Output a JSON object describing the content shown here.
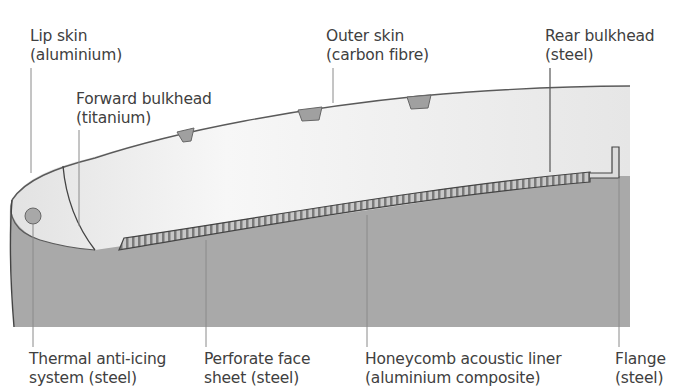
{
  "diagram": {
    "colors": {
      "body_gray": "#a9a9a9",
      "skin_light": "#ececec",
      "outline": "#555555",
      "leader_line": "#8a8a8a",
      "stiffener": "#a0a0a0",
      "text": "#404040"
    },
    "labels_top": [
      {
        "id": "lip-skin",
        "line1": "Lip skin",
        "line2": "(aluminium)"
      },
      {
        "id": "forward-bulkhead",
        "line1": "Forward bulkhead",
        "line2": "(titanium)"
      },
      {
        "id": "outer-skin",
        "line1": "Outer skin",
        "line2": "(carbon fibre)"
      },
      {
        "id": "rear-bulkhead",
        "line1": "Rear bulkhead",
        "line2": "(steel)"
      }
    ],
    "labels_bottom": [
      {
        "id": "thermal-anti-icing",
        "line1": "Thermal anti-icing",
        "line2": "system (steel)"
      },
      {
        "id": "perforate-face-sheet",
        "line1": "Perforate face",
        "line2": "sheet (steel)"
      },
      {
        "id": "honeycomb-liner",
        "line1": "Honeycomb acoustic liner",
        "line2": "(aluminium composite)"
      },
      {
        "id": "flange",
        "line1": "Flange",
        "line2": "(steel)"
      }
    ]
  }
}
